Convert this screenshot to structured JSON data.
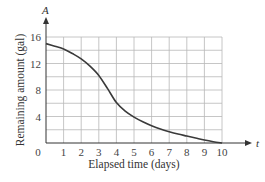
{
  "chart_data": {
    "type": "line",
    "title": "",
    "xlabel": "Elapsed time (days)",
    "ylabel": "Remaining amount (gal)",
    "x_axis_symbol": "t",
    "y_axis_symbol": "A",
    "xlim": [
      0,
      10
    ],
    "ylim": [
      0,
      16
    ],
    "x_ticks": [
      "0",
      "1",
      "2",
      "3",
      "4",
      "5",
      "6",
      "7",
      "8",
      "9",
      "10"
    ],
    "y_ticks": [
      "4",
      "8",
      "12",
      "16"
    ],
    "grid": true,
    "grid_x_step": 1,
    "grid_y_step": 2,
    "legend": null,
    "series": [
      {
        "name": "A(t)",
        "x": [
          0,
          0.5,
          1,
          1.5,
          2,
          2.5,
          3,
          3.5,
          4,
          4.5,
          5,
          5.5,
          6,
          6.5,
          7,
          7.5,
          8,
          8.5,
          9,
          9.5,
          10
        ],
        "values": [
          15.0,
          14.6,
          14.2,
          13.5,
          12.7,
          11.6,
          10.2,
          8.2,
          6.1,
          4.8,
          3.9,
          3.2,
          2.6,
          2.1,
          1.7,
          1.35,
          1.05,
          0.75,
          0.45,
          0.2,
          0.0
        ]
      }
    ]
  }
}
